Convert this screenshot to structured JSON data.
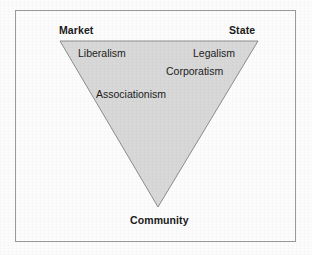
{
  "figure": {
    "type": "inverted-triangle-diagram",
    "colors": {
      "page_background": "#fcfcfc",
      "frame_border": "#9a9a9a",
      "triangle_fill": "#d8d8d8",
      "triangle_stroke": "#8c8c8c",
      "text": "#1a1a1a"
    },
    "frame": {
      "x": 15,
      "y": 10,
      "width": 281,
      "height": 232
    },
    "triangle": {
      "points": "60,41 258,41 158,207",
      "vertices": [
        {
          "name": "top-left",
          "x": 60,
          "y": 41
        },
        {
          "name": "top-right",
          "x": 258,
          "y": 41
        },
        {
          "name": "bottom",
          "x": 158,
          "y": 207
        }
      ]
    },
    "vertex_labels": [
      {
        "id": "market",
        "text": "Market",
        "position": "top-left",
        "bold": true
      },
      {
        "id": "state",
        "text": "State",
        "position": "top-right",
        "bold": true
      },
      {
        "id": "community",
        "text": "Community",
        "position": "bottom",
        "bold": true
      }
    ],
    "interior_labels": [
      {
        "id": "liberalism",
        "text": "Liberalism",
        "bold": false
      },
      {
        "id": "legalism",
        "text": "Legalism",
        "bold": false
      },
      {
        "id": "corporatism",
        "text": "Corporatism",
        "bold": false
      },
      {
        "id": "associationism",
        "text": "Associationism",
        "bold": false
      }
    ]
  }
}
